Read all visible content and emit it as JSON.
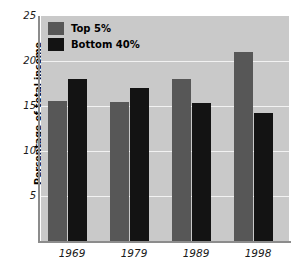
{
  "chart_data": {
    "type": "bar",
    "title": "",
    "xlabel": "",
    "ylabel": "Percentage of total income",
    "categories": [
      "1969",
      "1979",
      "1989",
      "1998"
    ],
    "series": [
      {
        "name": "Top 5%",
        "color": "#575757",
        "values": [
          15.6,
          15.4,
          18.0,
          21.0
        ]
      },
      {
        "name": "Bottom 40%",
        "color": "#131313",
        "values": [
          18.0,
          17.0,
          15.3,
          14.2
        ]
      }
    ],
    "ylim": [
      0,
      25
    ],
    "yticks": [
      25,
      20,
      15,
      10,
      5
    ],
    "grid": true,
    "legend_position": "top-left",
    "plot_background": "#c9c9c9",
    "gridline_color": "#f2f2f2"
  },
  "legend": {
    "items": [
      {
        "label": "Top 5%"
      },
      {
        "label": "Bottom 40%"
      }
    ]
  },
  "axes": {
    "y_title": "Percentage of total income",
    "y_tick_labels": [
      "25",
      "20",
      "15",
      "10",
      "5"
    ],
    "x_tick_labels": [
      "1969",
      "1979",
      "1989",
      "1998"
    ]
  }
}
